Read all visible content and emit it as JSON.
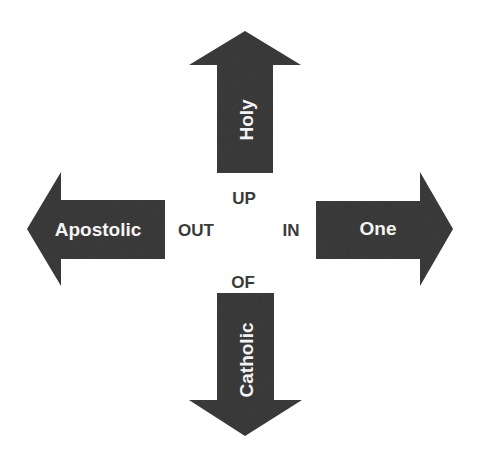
{
  "diagram": {
    "colors": {
      "arrow_fill": "#3d3d3d",
      "arrow_text": "#f4f4f4",
      "center_text": "#3a3a3a",
      "background": "#ffffff"
    },
    "arrows": {
      "up": {
        "label": "Holy",
        "direction": "up"
      },
      "left": {
        "label": "Apostolic",
        "direction": "left"
      },
      "right": {
        "label": "One",
        "direction": "right"
      },
      "down": {
        "label": "Catholic",
        "direction": "down"
      }
    },
    "center_labels": {
      "up": "UP",
      "out": "OUT",
      "in": "IN",
      "of": "OF"
    }
  }
}
